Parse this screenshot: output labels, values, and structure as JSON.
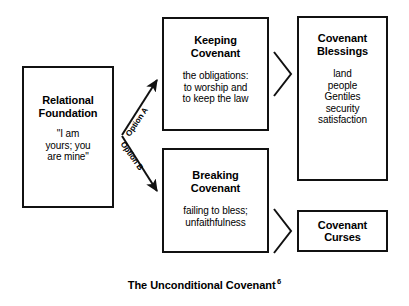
{
  "diagram": {
    "caption": "The Unconditional Covenant",
    "caption_footnote": "6",
    "line_color": "#111111",
    "background": "#ffffff",
    "boxes": {
      "relational_foundation": {
        "title": "Relational\nFoundation",
        "body": "\"I am\nyours; you\nare mine\""
      },
      "keeping_covenant": {
        "title": "Keeping\nCovenant",
        "body": "the obligations:\nto worship and\nto keep the law"
      },
      "breaking_covenant": {
        "title": "Breaking\nCovenant",
        "body": "failing to bless;\nunfaithfulness"
      },
      "covenant_blessings": {
        "title": "Covenant\nBlessings",
        "body": "land\npeople\nGentiles\nsecurity\nsatisfaction"
      },
      "covenant_curses": {
        "title": "Covenant\nCurses",
        "body": ""
      }
    },
    "connectors": {
      "option_a_label": "Option A",
      "option_b_label": "Option B"
    }
  }
}
